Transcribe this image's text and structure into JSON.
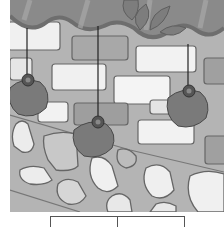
{
  "illustration": {
    "subject": "persimmons hanging from roof eaves in front of a brick and stone wall",
    "palette": {
      "wall_mortar": "#b4b4b4",
      "brick_light": "#f0f0f0",
      "brick_dark": "#9c9c9c",
      "roof_tile": "#8a8a8a",
      "roof_edge": "#6e6e6e",
      "leaf": "#7d7d7d",
      "persimmon": "#7a7a7a",
      "persimmon_outline": "#4a4a4a",
      "string": "#222222",
      "stone_light": "#ececec",
      "stone_mid": "#c8c8c8",
      "outline": "#666666"
    },
    "persimmons": [
      {
        "label": "persimmon-left",
        "cx": 27,
        "cy": 96
      },
      {
        "label": "persimmon-middle",
        "cx": 91,
        "cy": 138
      },
      {
        "label": "persimmon-right",
        "cx": 182,
        "cy": 103
      }
    ]
  },
  "answer_table": {
    "cells": [
      "",
      ""
    ]
  }
}
